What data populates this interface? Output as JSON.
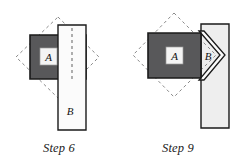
{
  "figure": {
    "type": "geometric-construction-diagram",
    "background_color": "#ffffff",
    "panels": [
      {
        "id": "step6",
        "caption": "Step 6",
        "labels": {
          "square": "A",
          "strip": "B"
        },
        "shapes": {
          "dashed_diamond": {
            "name": "dashed-diamond-outline",
            "stroke": "#8a8a8a",
            "fill": "none",
            "dash": "3,3",
            "points": "58,17 99,57 58,98 16,57"
          },
          "dark_square": {
            "name": "dark-square-a",
            "fill": "#58585a",
            "stroke": "#1a1a1a",
            "points": "30,35 86,35 86,79 30,79"
          },
          "a_box": {
            "name": "label-box-a",
            "fill": "#f4f4f4",
            "stroke": "#9a9a9a",
            "x": 40,
            "y": 48,
            "w": 17,
            "h": 17
          },
          "vertical_strip": {
            "name": "white-strip-b",
            "fill": "#fbfbfb",
            "stroke": "#1a1a1a",
            "points": "58,25 86,25 86,130 58,130"
          },
          "fold_line": {
            "name": "dashed-fold-line",
            "stroke": "#6f6f6f",
            "dash": "3,3",
            "x1": 72,
            "y1": 28,
            "x2": 72,
            "y2": 80
          }
        }
      },
      {
        "id": "step9",
        "caption": "Step 9",
        "labels": {
          "square": "A",
          "strip": "B"
        },
        "shapes": {
          "dashed_diamond": {
            "name": "dashed-diamond-outline",
            "stroke": "#8a8a8a",
            "fill": "none",
            "dash": "3,3",
            "points": "55,13 97,55 55,97 14,55"
          },
          "back_strip": {
            "name": "light-back-strip",
            "fill": "#eeeeee",
            "stroke": "#1a1a1a",
            "points": "82,24 110,24 110,128 82,128"
          },
          "dark_square": {
            "name": "dark-square-a",
            "fill": "#58585a",
            "stroke": "#1a1a1a",
            "points": "29,33 82,33 82,78 29,78"
          },
          "a_box": {
            "name": "label-box-a",
            "fill": "#f4f4f4",
            "stroke": "#9a9a9a",
            "x": 47,
            "y": 47,
            "w": 17,
            "h": 17
          },
          "chevron": {
            "name": "folded-chevron-b",
            "fill": "#fbfbfb",
            "stroke": "#1a1a1a",
            "points": "82,33 97,55 82,78 86,78 100,55 86,33"
          },
          "chevron_outer": {
            "name": "folded-chevron-b-outline",
            "fill": "#fbfbfb",
            "stroke": "#1a1a1a",
            "points": "82,33 100,55 82,78"
          }
        }
      }
    ]
  }
}
